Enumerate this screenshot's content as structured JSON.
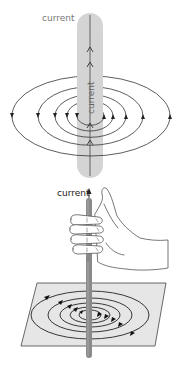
{
  "figure": {
    "top_panel": {
      "title": "Magnetic field around a straight current-carrying wire",
      "external_label": "current",
      "wire_label": "current",
      "colors": {
        "wire_tube": "#d4d4d4",
        "wire_line": "#555555",
        "field_lines": "#333333",
        "label_text": "#777777"
      },
      "field_loops": 5,
      "field_direction": "counter-clockwise when viewed from above"
    },
    "bottom_panel": {
      "title": "Right-hand grip rule",
      "current_label": "current",
      "colors": {
        "rod": "#8a8a8a",
        "plane": "#e6e6e6",
        "plane_edge": "#444444",
        "field_lines": "#222222",
        "hand_outline": "#555555",
        "label_text": "#222222"
      },
      "field_loops": 5
    }
  }
}
